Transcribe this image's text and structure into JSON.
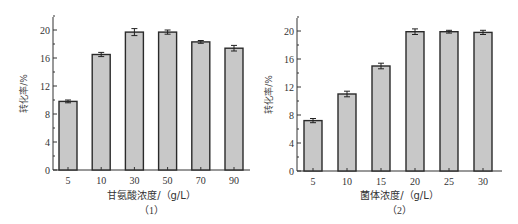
{
  "chart_data": [
    {
      "type": "bar",
      "panel_label": "（1）",
      "title": "",
      "xlabel": "甘氨酸浓度/（g/L）",
      "ylabel": "转化率/%",
      "categories": [
        "5",
        "10",
        "30",
        "50",
        "70",
        "90"
      ],
      "values": [
        9.8,
        16.5,
        19.7,
        19.7,
        18.3,
        17.4
      ],
      "errors": [
        0.2,
        0.3,
        0.5,
        0.3,
        0.2,
        0.4
      ],
      "yticks": [
        0,
        4,
        8,
        12,
        16,
        20
      ],
      "ylim": [
        0,
        22
      ],
      "grid": false,
      "bar_color": "#c8c8c8",
      "edge_color": "#2a2a2a"
    },
    {
      "type": "bar",
      "panel_label": "（2）",
      "title": "",
      "xlabel": "菌体浓度/（g/L）",
      "ylabel": "转化率/%",
      "categories": [
        "5",
        "10",
        "15",
        "20",
        "25",
        "30"
      ],
      "values": [
        7.2,
        11.0,
        15.0,
        19.9,
        19.9,
        19.8
      ],
      "errors": [
        0.3,
        0.4,
        0.4,
        0.4,
        0.2,
        0.3
      ],
      "yticks": [
        0,
        4,
        8,
        12,
        16,
        20
      ],
      "ylim": [
        0,
        22
      ],
      "grid": false,
      "bar_color": "#c8c8c8",
      "edge_color": "#2a2a2a"
    }
  ]
}
